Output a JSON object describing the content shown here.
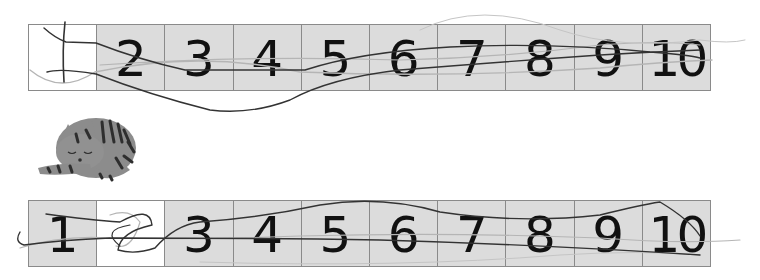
{
  "worksheet": {
    "top_strip": {
      "cells": [
        {
          "label": "",
          "state": "blank-handwritten"
        },
        {
          "label": "2"
        },
        {
          "label": "3"
        },
        {
          "label": "4"
        },
        {
          "label": "5"
        },
        {
          "label": "6"
        },
        {
          "label": "7"
        },
        {
          "label": "8"
        },
        {
          "label": "9"
        },
        {
          "label": "10"
        }
      ]
    },
    "bottom_strip": {
      "cells": [
        {
          "label": "1"
        },
        {
          "label": "",
          "state": "blank-handwritten"
        },
        {
          "label": "3"
        },
        {
          "label": "4"
        },
        {
          "label": "5"
        },
        {
          "label": "6"
        },
        {
          "label": "7"
        },
        {
          "label": "8"
        },
        {
          "label": "9"
        },
        {
          "label": "10"
        }
      ]
    },
    "illustration": "sleeping-tabby-cat",
    "colors": {
      "cell_fill": "#dcdcdc",
      "blank_cell_fill": "#ffffff",
      "grid_line": "#8a8a8a",
      "digit": "#111111",
      "scribble_dark": "#333333",
      "scribble_light": "#b5b5b5",
      "cat_body": "#8c8c8c",
      "cat_stripes": "#2e2e2e"
    }
  }
}
